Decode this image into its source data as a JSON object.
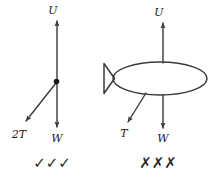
{
  "figure": {
    "background_color": "#ffffff",
    "stroke_color": "#3a3a3a",
    "label_color": "#1b1b1b",
    "width": 214,
    "height": 178
  },
  "left_diagram": {
    "name": "correct-force-diagram",
    "verdict": "✓✓✓",
    "verdict_meaning": "correct",
    "forces": [
      {
        "label": "U",
        "direction": "up",
        "description": "upthrust acting upward"
      },
      {
        "label": "2T",
        "direction": "down-left",
        "description": "tension of two ropes acting down-left"
      },
      {
        "label": "W",
        "direction": "down",
        "description": "weight acting downward"
      }
    ],
    "labels": {
      "upthrust": "U",
      "tension": "2T",
      "weight": "W"
    }
  },
  "right_diagram": {
    "name": "incorrect-force-diagram",
    "verdict": "✗✗✗",
    "verdict_meaning": "incorrect",
    "object": "airship",
    "forces": [
      {
        "label": "U",
        "direction": "up",
        "description": "upthrust acting upward"
      },
      {
        "label": "T",
        "direction": "down-left",
        "description": "tension acting down-left"
      },
      {
        "label": "W",
        "direction": "down",
        "description": "weight acting downward"
      }
    ],
    "labels": {
      "upthrust": "U",
      "tension": "T",
      "weight": "W"
    }
  }
}
